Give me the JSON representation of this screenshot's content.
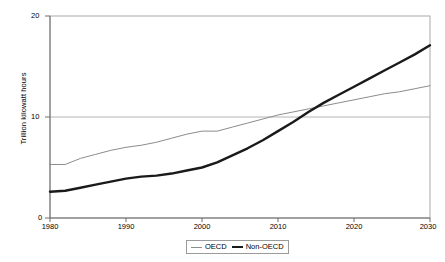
{
  "chart_data": {
    "type": "line",
    "title": "",
    "xlabel": "",
    "ylabel": "Trillion kilowatt hours",
    "xlim": [
      1980,
      2030
    ],
    "ylim": [
      0,
      20
    ],
    "ytick_labels": [
      "0",
      "10",
      "20"
    ],
    "yticks": [
      0,
      10,
      20
    ],
    "xtick_labels": [
      "1980",
      "1990",
      "2000",
      "2010",
      "2020",
      "2030"
    ],
    "xticks": [
      1980,
      1990,
      2000,
      2010,
      2020,
      2030
    ],
    "grid": "horizontal gridline at y=10 only",
    "legend_position": "bottom-center",
    "x": [
      1980,
      1982,
      1984,
      1986,
      1988,
      1990,
      1992,
      1994,
      1996,
      1998,
      2000,
      2002,
      2004,
      2006,
      2008,
      2010,
      2012,
      2014,
      2016,
      2018,
      2020,
      2022,
      2024,
      2026,
      2028,
      2030
    ],
    "series": [
      {
        "name": "OECD",
        "color": "#8c8c8c",
        "line_width": 1,
        "values": [
          5.3,
          5.3,
          5.9,
          6.3,
          6.7,
          7.0,
          7.2,
          7.5,
          7.9,
          8.3,
          8.6,
          8.6,
          9.0,
          9.4,
          9.8,
          10.2,
          10.5,
          10.8,
          11.1,
          11.4,
          11.7,
          12.0,
          12.3,
          12.5,
          12.8,
          13.1
        ]
      },
      {
        "name": "Non-OECD",
        "color": "#1a1a1a",
        "line_width": 2.4,
        "values": [
          2.6,
          2.7,
          3.0,
          3.3,
          3.6,
          3.9,
          4.1,
          4.2,
          4.4,
          4.7,
          5.0,
          5.5,
          6.2,
          6.9,
          7.7,
          8.6,
          9.5,
          10.5,
          11.4,
          12.2,
          13.0,
          13.8,
          14.6,
          15.4,
          16.2,
          17.1
        ]
      }
    ],
    "annotations": [
      {
        "text": "Non-OECD overtakes OECD near 2015 at about 11 trillion kilowatt hours"
      }
    ]
  },
  "legend": {
    "items": [
      {
        "label": "OECD",
        "style": "thin-line"
      },
      {
        "label": "Non-OECD",
        "style": "thick-line"
      }
    ]
  },
  "axes": {
    "y_title": "Trillion kilowatt hours",
    "y_labels": {
      "top": "20",
      "mid": "10",
      "zero": "0"
    },
    "x_labels": [
      "1980",
      "1990",
      "2000",
      "2010",
      "2020",
      "2030"
    ]
  }
}
